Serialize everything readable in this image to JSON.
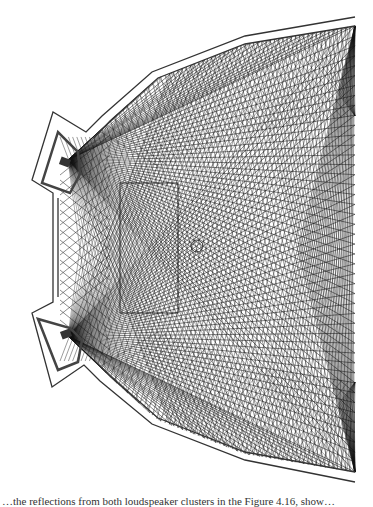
{
  "figure": {
    "elements": [
      "outer-wall",
      "inner-wall",
      "speaker-alcove-top",
      "speaker-alcove-bottom",
      "court-rectangle",
      "center-circle",
      "ray-paths"
    ],
    "colors": {
      "walls": "#333333",
      "rays": "#111111",
      "court": "#222222",
      "background": "#ffffff"
    }
  },
  "caption": {
    "text": "…the reflections from both loudspeaker clusters in the Figure 4.16, show…"
  }
}
